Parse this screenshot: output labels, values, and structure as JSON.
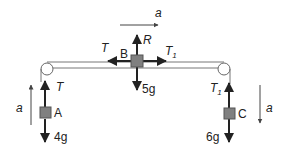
{
  "diagram": {
    "type": "connected-particles-pulley-system",
    "colors": {
      "background": "#ffffff",
      "ink": "#222222",
      "block_fill": "#808080",
      "block_stroke": "#555555",
      "table_line": "#777777",
      "pulley_stroke": "#666666",
      "acceleration_arrow": "#555555"
    },
    "top_acceleration": {
      "label": "a",
      "direction": "right"
    },
    "blocks": {
      "A": {
        "label": "A",
        "tension_label": "T",
        "tension_sub": "",
        "weight_label": "4g",
        "acceleration_label": "a",
        "acceleration_direction": "up"
      },
      "B": {
        "label": "B",
        "reaction_label": "R",
        "left_tension_label": "T",
        "right_tension_label": "T",
        "right_tension_sub": "1",
        "weight_label": "5g"
      },
      "C": {
        "label": "C",
        "tension_label": "T",
        "tension_sub": "1",
        "weight_label": "6g",
        "acceleration_label": "a",
        "acceleration_direction": "down"
      }
    },
    "pulleys": [
      {
        "name": "left-pulley",
        "position": "left edge"
      },
      {
        "name": "right-pulley",
        "position": "right edge"
      }
    ]
  }
}
